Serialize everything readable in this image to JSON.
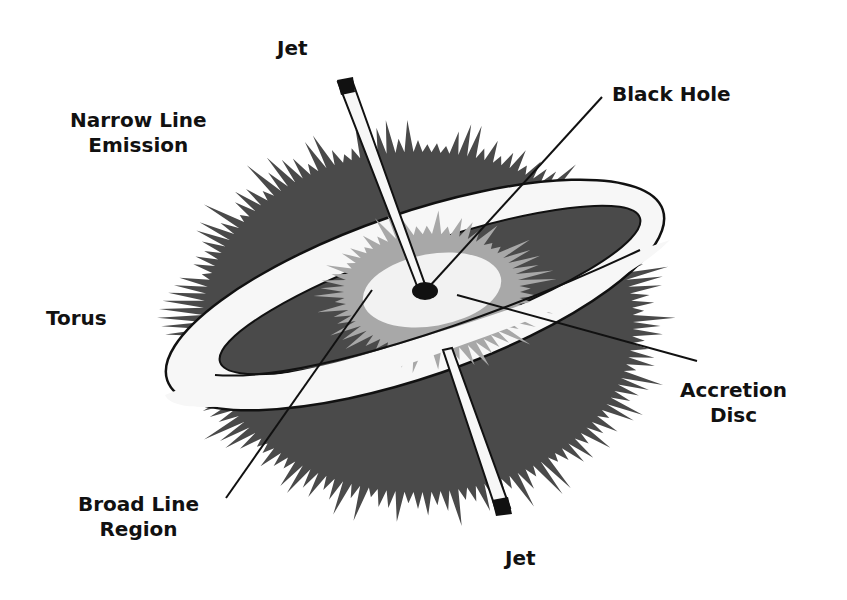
{
  "diagram": {
    "labels": {
      "jet_top": "Jet",
      "narrow_line_emission": "Narrow Line\nEmission",
      "black_hole": "Black Hole",
      "torus": "Torus",
      "accretion_disc": "Accretion\nDisc",
      "broad_line_region": "Broad Line\nRegion",
      "jet_bottom": "Jet"
    },
    "colors": {
      "background": "#ffffff",
      "narrow_line_cloud": "#4a4a4a",
      "broad_line_glow": "#a8a8a8",
      "accretion_disc": "#f2f2f2",
      "torus": "#f7f7f7",
      "black_hole": "#111111",
      "outline": "#111111"
    }
  }
}
